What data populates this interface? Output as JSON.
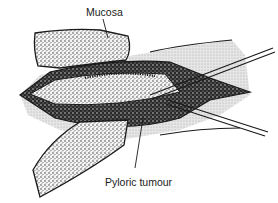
{
  "figure": {
    "labels": {
      "mucosa": "Mucosa",
      "pyloric_tumour": "Pyloric tumour"
    },
    "colors": {
      "ink": "#1a1a1a",
      "shading": "#d9d9d9",
      "background": "#ffffff"
    }
  }
}
